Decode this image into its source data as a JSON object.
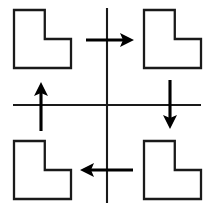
{
  "figure": {
    "width": 212,
    "height": 209,
    "background_color": "#ffffff",
    "line_color": "#1a1a1a",
    "arrow_color": "#000000"
  },
  "axes": {
    "vertical": {
      "name": "vertical-axis",
      "x": 107,
      "y_start": 8,
      "y_end": 203
    },
    "horizontal": {
      "name": "horizontal-axis",
      "y": 105,
      "x_start": 13,
      "x_end": 201
    }
  },
  "shapes": [
    {
      "id": "l-shape-top-left",
      "quadrant": "top-left",
      "label": "L",
      "x": 14,
      "y": 10,
      "width": 57,
      "height": 58,
      "notch_corner": "top-right",
      "notch_width_ratio": 0.46,
      "notch_height_ratio": 0.5,
      "fill": "#ffffff",
      "stroke": "#1a1a1a"
    },
    {
      "id": "l-shape-top-right",
      "quadrant": "top-right",
      "label": "L",
      "x": 144,
      "y": 10,
      "width": 57,
      "height": 58,
      "notch_corner": "top-right",
      "notch_width_ratio": 0.46,
      "notch_height_ratio": 0.5,
      "fill": "#ffffff",
      "stroke": "#1a1a1a"
    },
    {
      "id": "l-shape-bottom-left",
      "quadrant": "bottom-left",
      "label": "L",
      "x": 14,
      "y": 141,
      "width": 57,
      "height": 58,
      "notch_corner": "top-right",
      "notch_width_ratio": 0.46,
      "notch_height_ratio": 0.5,
      "fill": "#ffffff",
      "stroke": "#1a1a1a"
    },
    {
      "id": "l-shape-bottom-right",
      "quadrant": "bottom-right",
      "label": "L",
      "x": 144,
      "y": 141,
      "width": 57,
      "height": 58,
      "notch_corner": "top-right",
      "notch_width_ratio": 0.46,
      "notch_height_ratio": 0.5,
      "fill": "#ffffff",
      "stroke": "#1a1a1a"
    }
  ],
  "arrows": [
    {
      "id": "arrow-right-top",
      "icon": "arrow-right-icon",
      "direction": "right",
      "position": "top-center",
      "x_start": 86,
      "x_end": 134,
      "y": 40,
      "color": "#000000"
    },
    {
      "id": "arrow-down-right",
      "icon": "arrow-down-icon",
      "direction": "down",
      "position": "middle-right",
      "x": 170,
      "y_start": 80,
      "y_end": 129,
      "color": "#000000"
    },
    {
      "id": "arrow-left-bottom",
      "icon": "arrow-left-icon",
      "direction": "left",
      "position": "bottom-center",
      "x_start": 80,
      "x_end": 133,
      "y": 170,
      "color": "#000000"
    },
    {
      "id": "arrow-up-left",
      "icon": "arrow-up-icon",
      "direction": "up",
      "position": "middle-left",
      "x": 41,
      "y_start": 82,
      "y_end": 131,
      "color": "#000000"
    }
  ]
}
